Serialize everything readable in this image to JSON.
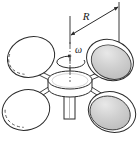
{
  "figure": {
    "labels": {
      "radius": "R",
      "angular_velocity": "ω"
    },
    "colors": {
      "stroke": "#2b2b2b",
      "sphere_shaded_fill": "#c9c9c9",
      "sphere_shaded_rim": "#e4e4e4",
      "sphere_plain_fill": "#ffffff",
      "hub_fill": "#ffffff",
      "background": "#ffffff",
      "axis": "#4a4a4a"
    },
    "elements": {
      "spheres": [
        {
          "name": "sphere-upper-left",
          "shaded": false,
          "cx": 31,
          "cy": 57,
          "rx": 24,
          "ry": 20,
          "rot": -22
        },
        {
          "name": "sphere-upper-right",
          "shaded": true,
          "cx": 110,
          "cy": 60,
          "rx": 24,
          "ry": 20,
          "rot": 22
        },
        {
          "name": "sphere-lower-left",
          "shaded": false,
          "cx": 26,
          "cy": 110,
          "rx": 24,
          "ry": 20,
          "rot": -18
        },
        {
          "name": "sphere-lower-right",
          "shaded": true,
          "cx": 112,
          "cy": 112,
          "rx": 24,
          "ry": 20,
          "rot": 18
        }
      ],
      "hub": {
        "name": "central-hub",
        "cx": 70,
        "cy": 80,
        "rx": 22,
        "ry": 9,
        "height": 13
      },
      "shaft": {
        "name": "drive-shaft",
        "x": 64,
        "y": 93,
        "width": 10,
        "height": 26
      },
      "axis_line": {
        "name": "rotation-axis",
        "x": 70,
        "y1": 20,
        "y2": 100
      },
      "dimension": {
        "name": "radius-dimension",
        "left_tick_x": 70,
        "left_tick_y1": 16,
        "left_tick_y2": 44,
        "right_tick_x": 119,
        "right_tick_y1": 2,
        "right_tick_y2": 45,
        "arrow_x1": 70,
        "arrow_y1": 35,
        "arrow_x2": 119,
        "arrow_y2": 7,
        "label_x": 88,
        "label_y": 17
      },
      "rotation_arrow": {
        "name": "rotation-direction-arrow",
        "cx": 70,
        "cy": 62,
        "rx": 14,
        "ry": 6
      },
      "omega_label": {
        "x": 74,
        "y": 52
      }
    }
  }
}
